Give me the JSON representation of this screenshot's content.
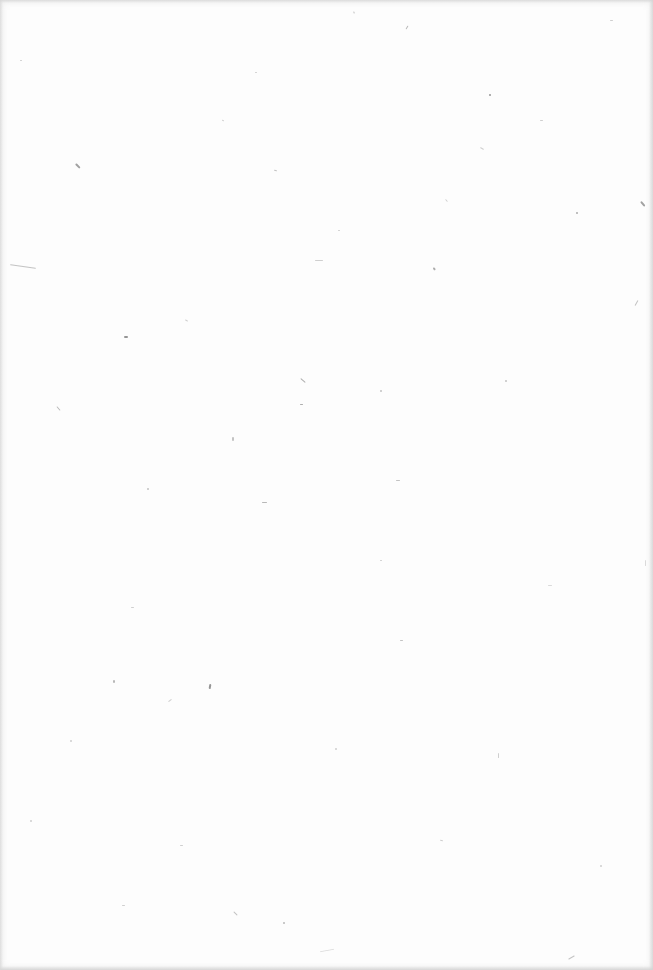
{
  "document": {
    "type": "blank-page",
    "paper_color": "#fdfdfd",
    "speck_color": "#8a8a8a",
    "specks": [
      [
        75,
        165,
        6,
        1.5,
        45,
        0.8
      ],
      [
        10,
        266,
        26,
        1,
        8,
        0.5
      ],
      [
        124,
        336,
        4,
        2,
        0,
        0.9
      ],
      [
        640,
        203,
        6,
        1.5,
        50,
        0.8
      ],
      [
        489,
        94,
        2,
        2,
        0,
        0.9
      ],
      [
        405,
        27,
        4,
        1,
        -60,
        0.6
      ],
      [
        353,
        12,
        2,
        1,
        70,
        0.5
      ],
      [
        433,
        268,
        3,
        1.5,
        60,
        0.7
      ],
      [
        300,
        380,
        6,
        1,
        40,
        0.7
      ],
      [
        56,
        408,
        5,
        1,
        50,
        0.6
      ],
      [
        209,
        684,
        2,
        5,
        10,
        0.9
      ],
      [
        113,
        680,
        2,
        3,
        0,
        0.6
      ],
      [
        262,
        502,
        5,
        1,
        0,
        0.6
      ],
      [
        233,
        913,
        5,
        1,
        45,
        0.5
      ],
      [
        283,
        922,
        2,
        2,
        0,
        0.6
      ],
      [
        576,
        212,
        2,
        1.5,
        0,
        0.7
      ],
      [
        274,
        170,
        3,
        1,
        20,
        0.5
      ],
      [
        315,
        260,
        8,
        1,
        0,
        0.4
      ],
      [
        396,
        480,
        4,
        1,
        0,
        0.5
      ],
      [
        480,
        148,
        4,
        1,
        30,
        0.4
      ],
      [
        636,
        300,
        1,
        6,
        30,
        0.5
      ],
      [
        300,
        404,
        3,
        1,
        0,
        0.7
      ],
      [
        232,
        437,
        2,
        4,
        0,
        0.5
      ],
      [
        498,
        753,
        1,
        5,
        0,
        0.4
      ],
      [
        645,
        560,
        1,
        6,
        0,
        0.3
      ],
      [
        380,
        390,
        2,
        2,
        0,
        0.5
      ],
      [
        147,
        488,
        2,
        2,
        0,
        0.5
      ],
      [
        131,
        607,
        3,
        1,
        0,
        0.4
      ],
      [
        185,
        320,
        3,
        1,
        30,
        0.4
      ],
      [
        548,
        585,
        4,
        1,
        0,
        0.3
      ],
      [
        400,
        640,
        3,
        1,
        0,
        0.5
      ],
      [
        320,
        950,
        14,
        1,
        -10,
        0.3
      ],
      [
        568,
        957,
        7,
        1,
        -30,
        0.5
      ],
      [
        122,
        905,
        3,
        1,
        0,
        0.4
      ],
      [
        600,
        865,
        2,
        2,
        0,
        0.4
      ],
      [
        440,
        840,
        3,
        1,
        20,
        0.4
      ],
      [
        30,
        820,
        2,
        2,
        0,
        0.4
      ],
      [
        180,
        845,
        3,
        1,
        0,
        0.4
      ],
      [
        505,
        380,
        2,
        1.5,
        0,
        0.5
      ],
      [
        540,
        120,
        3,
        1,
        0,
        0.4
      ],
      [
        20,
        60,
        2,
        1,
        0,
        0.4
      ],
      [
        610,
        20,
        3,
        1,
        0,
        0.4
      ],
      [
        380,
        560,
        2,
        1,
        0,
        0.4
      ],
      [
        70,
        740,
        2,
        2,
        0,
        0.4
      ],
      [
        338,
        230,
        2,
        1,
        0,
        0.4
      ],
      [
        222,
        120,
        2,
        1,
        30,
        0.4
      ],
      [
        445,
        200,
        3,
        1,
        50,
        0.4
      ],
      [
        255,
        72,
        2,
        1,
        0,
        0.4
      ],
      [
        168,
        700,
        4,
        1,
        -40,
        0.4
      ],
      [
        335,
        748,
        2,
        2,
        0,
        0.4
      ]
    ]
  }
}
